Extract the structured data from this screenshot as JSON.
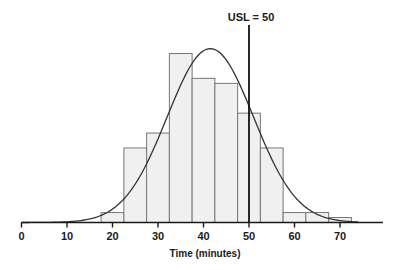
{
  "chart_data": {
    "type": "bar",
    "title": "",
    "xlabel": "Time (minutes)",
    "ylabel": "",
    "xlim": [
      0,
      80
    ],
    "x_ticks": [
      0,
      10,
      20,
      30,
      40,
      50,
      60,
      70
    ],
    "bin_width": 5,
    "categories": [
      "17.5-22.5",
      "22.5-27.5",
      "27.5-32.5",
      "32.5-37.5",
      "37.5-42.5",
      "42.5-47.5",
      "47.5-52.5",
      "52.5-57.5",
      "57.5-62.5",
      "62.5-67.5",
      "67.5-72.5"
    ],
    "bin_starts": [
      17.5,
      22.5,
      27.5,
      32.5,
      37.5,
      42.5,
      47.5,
      52.5,
      57.5,
      62.5,
      67.5
    ],
    "values": [
      2,
      15,
      18,
      34,
      29,
      28,
      22,
      15,
      2,
      2,
      1
    ],
    "fitted_curve": {
      "type": "normal",
      "mean": 41.5,
      "sd": 9.5,
      "peak_relative": 35
    },
    "reference_line": {
      "label": "USL = 50",
      "x": 50
    },
    "grid": false,
    "legend": null,
    "colors": {
      "bar_fill": "#f0f0f0",
      "bar_stroke": "#777777",
      "curve": "#333333",
      "axis": "#1a1a1a",
      "usl_line": "#111111"
    }
  },
  "axis": {
    "x_title": "Time (minutes)",
    "tick_labels": [
      "0",
      "10",
      "20",
      "30",
      "40",
      "50",
      "60",
      "70"
    ]
  },
  "annotation": {
    "usl_label": "USL = 50"
  }
}
